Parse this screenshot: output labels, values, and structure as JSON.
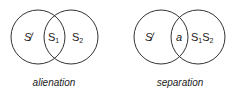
{
  "diagrams": [
    {
      "caption": "alienation",
      "left_label": "S̸",
      "overlap_label": "S",
      "overlap_sub": "1",
      "right_label": "S",
      "right_sub": "2"
    },
    {
      "caption": "separation",
      "left_label": "S̸",
      "overlap_label": "a",
      "right_label": "S",
      "right_sub1": "1",
      "right_label2": "S",
      "right_sub2": "2"
    }
  ]
}
